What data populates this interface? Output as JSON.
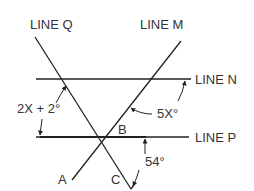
{
  "diagram": {
    "lines": {
      "q": "LINE Q",
      "m": "LINE M",
      "n": "LINE N",
      "p": "LINE P"
    },
    "points": {
      "a": "A",
      "b": "B",
      "c": "C"
    },
    "angles": {
      "angle_q_n": "2X + 2°",
      "angle_m_n": "5X°",
      "angle_p_c": "54°"
    },
    "colors": {
      "stroke": "#222222",
      "text": "#333333",
      "background": "#ffffff"
    }
  }
}
